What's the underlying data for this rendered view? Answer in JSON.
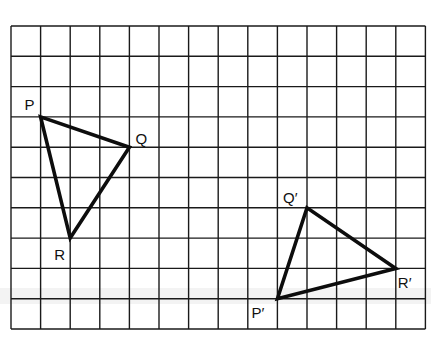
{
  "figure": {
    "type": "grid-diagram",
    "grid": {
      "columns": 14,
      "rows": 10,
      "origin_px": [
        11,
        26
      ],
      "cell_w": 29.6,
      "cell_h": 30.3,
      "line_color": "#1a1a1a"
    },
    "triangles": [
      {
        "name": "PQR",
        "vertices": [
          {
            "label": "P",
            "col": 1,
            "row": 3,
            "label_dx": -16,
            "label_dy": -7
          },
          {
            "label": "Q",
            "col": 4,
            "row": 4,
            "label_dx": 6,
            "label_dy": -3
          },
          {
            "label": "R",
            "col": 2,
            "row": 7,
            "label_dx": -16,
            "label_dy": 22
          }
        ]
      },
      {
        "name": "P'Q'R'",
        "vertices": [
          {
            "label": "P′",
            "col": 9,
            "row": 9,
            "label_dx": -26,
            "label_dy": 19
          },
          {
            "label": "Q′",
            "col": 10,
            "row": 6,
            "label_dx": -24,
            "label_dy": -5
          },
          {
            "label": "R′",
            "col": 13,
            "row": 8,
            "label_dx": 2,
            "label_dy": 20
          }
        ]
      }
    ],
    "line_color": "#0d0d0d"
  }
}
